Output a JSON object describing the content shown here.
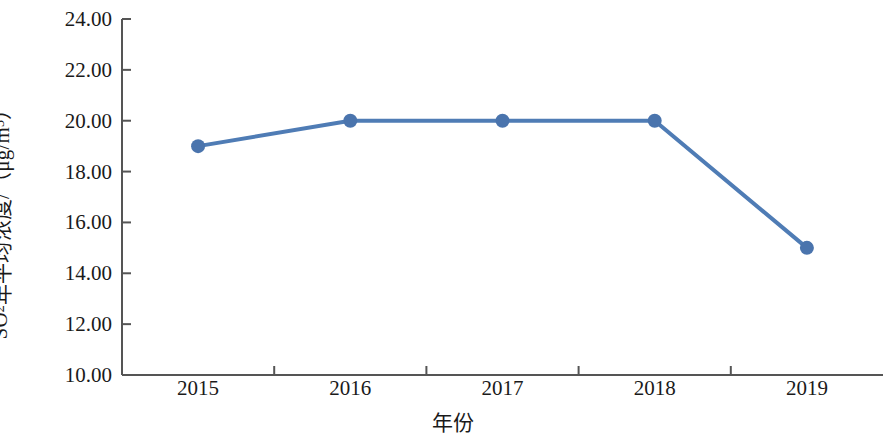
{
  "chart_data": {
    "type": "line",
    "title": "",
    "subtitle": "",
    "xlabel": "年份",
    "ylabel_parts": {
      "prefix": "SO",
      "subscript": "2",
      "middle": "年平均浓度/（μg/m",
      "superscript": "3",
      "suffix": "）"
    },
    "ylabel": "SO2年平均浓度/（μg/m3）",
    "categories": [
      "2015",
      "2016",
      "2017",
      "2018",
      "2019"
    ],
    "x": [
      2015,
      2016,
      2017,
      2018,
      2019
    ],
    "values": [
      19.0,
      20.0,
      20.0,
      20.0,
      15.0
    ],
    "series": [
      {
        "name": "SO2年平均浓度",
        "values": [
          19.0,
          20.0,
          20.0,
          20.0,
          15.0
        ]
      }
    ],
    "ylim": [
      10.0,
      24.0
    ],
    "ytick_values": [
      24.0,
      22.0,
      20.0,
      18.0,
      16.0,
      14.0,
      12.0,
      10.0
    ],
    "ytick_labels": [
      "24.00",
      "22.00",
      "20.00",
      "18.00",
      "16.00",
      "14.00",
      "12.00",
      "10.00"
    ],
    "xtick_labels": [
      "2015",
      "2016",
      "2017",
      "2018",
      "2019"
    ],
    "grid": false,
    "legend": false,
    "legend_position": "none",
    "colors": {
      "line": "#4f7cb5",
      "marker": "#4a74ad",
      "axis": "#555555",
      "text": "#1a1a1a",
      "background": "#ffffff"
    },
    "marker": "circle",
    "marker_size": 9,
    "line_width": 4,
    "annotations": []
  }
}
